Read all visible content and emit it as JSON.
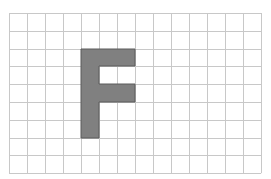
{
  "figure": {
    "letter": "F",
    "grid": {
      "columns": 14,
      "rows": 9,
      "line_color": "#c8c8c8",
      "background_color": "#ffffff"
    },
    "shape": {
      "fill_color": "#808080",
      "stroke_color": "#5a5a5a",
      "cells_comment": "filled cells as [column, row] pairs (0-indexed from top-left)",
      "cells": [
        [
          4,
          2
        ],
        [
          5,
          2
        ],
        [
          6,
          2
        ],
        [
          4,
          3
        ],
        [
          4,
          4
        ],
        [
          5,
          4
        ],
        [
          6,
          4
        ],
        [
          4,
          5
        ],
        [
          4,
          6
        ]
      ]
    }
  }
}
